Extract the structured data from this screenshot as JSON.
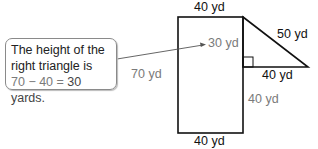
{
  "callout": {
    "line1": "The height of the",
    "line2": "right triangle is",
    "eq_part1": "70 − 40 = ",
    "eq_part2": "30 yards."
  },
  "labels": {
    "rect_top": "40 yd",
    "rect_bottom": "40 yd",
    "rect_left": "70 yd",
    "triangle_height": "30 yd",
    "hypotenuse": "50 yd",
    "triangle_base": "40 yd",
    "lower_right": "40 yd"
  },
  "colors": {
    "stroke": "#111111",
    "gray_label": "#7a7a7a",
    "arrow": "#555555"
  }
}
